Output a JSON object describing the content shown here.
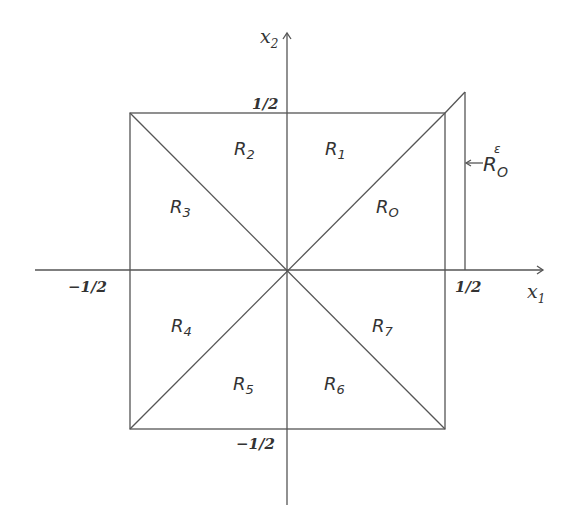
{
  "diagram": {
    "axes": {
      "x_label": "x",
      "x_sub": "1",
      "y_label": "x",
      "y_sub": "2"
    },
    "ticks": {
      "x_pos": "1/2",
      "x_neg": "−1/2",
      "y_pos": "1/2",
      "y_neg": "−1/2"
    },
    "regions": [
      {
        "id": "R0",
        "base": "R",
        "sub": "O"
      },
      {
        "id": "R1",
        "base": "R",
        "sub": "1"
      },
      {
        "id": "R2",
        "base": "R",
        "sub": "2"
      },
      {
        "id": "R3",
        "base": "R",
        "sub": "3"
      },
      {
        "id": "R4",
        "base": "R",
        "sub": "4"
      },
      {
        "id": "R5",
        "base": "R",
        "sub": "5"
      },
      {
        "id": "R6",
        "base": "R",
        "sub": "6"
      },
      {
        "id": "R7",
        "base": "R",
        "sub": "7"
      }
    ],
    "extension_region": {
      "base": "R",
      "sub": "O",
      "sup": "ε",
      "pointer": "←"
    },
    "line_color": "#555555",
    "text_color": "#333333"
  }
}
